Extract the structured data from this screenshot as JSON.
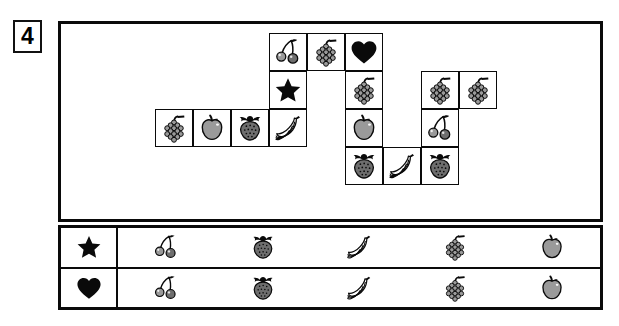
{
  "exercise": {
    "number": "4"
  },
  "puzzle": {
    "name": "fruit-crossword-grid",
    "cell_size": 38,
    "origin": {
      "x": 155,
      "y": 33
    },
    "cells": [
      {
        "col": 3,
        "row": 0,
        "icon": "cherries-icon"
      },
      {
        "col": 4,
        "row": 0,
        "icon": "grapes-icon"
      },
      {
        "col": 5,
        "row": 0,
        "icon": "heart-icon"
      },
      {
        "col": 3,
        "row": 1,
        "icon": "star-icon"
      },
      {
        "col": 5,
        "row": 1,
        "icon": "grapes-icon"
      },
      {
        "col": 7,
        "row": 1,
        "icon": "grapes-icon"
      },
      {
        "col": 8,
        "row": 1,
        "icon": "grapes-icon"
      },
      {
        "col": 0,
        "row": 2,
        "icon": "grapes-icon"
      },
      {
        "col": 1,
        "row": 2,
        "icon": "apple-icon"
      },
      {
        "col": 2,
        "row": 2,
        "icon": "strawberry-icon"
      },
      {
        "col": 3,
        "row": 2,
        "icon": "bananas-icon"
      },
      {
        "col": 5,
        "row": 2,
        "icon": "apple-icon"
      },
      {
        "col": 7,
        "row": 2,
        "icon": "cherries-icon"
      },
      {
        "col": 5,
        "row": 3,
        "icon": "strawberry-icon"
      },
      {
        "col": 6,
        "row": 3,
        "icon": "bananas-icon"
      },
      {
        "col": 7,
        "row": 3,
        "icon": "strawberry-icon"
      }
    ]
  },
  "legend": {
    "name": "answer-key-table",
    "rows": [
      {
        "symbol": "star-icon",
        "items": [
          "cherries-icon",
          "strawberry-icon",
          "bananas-icon",
          "grapes-icon",
          "apple-icon"
        ]
      },
      {
        "symbol": "heart-icon",
        "items": [
          "cherries-icon",
          "strawberry-icon",
          "bananas-icon",
          "grapes-icon",
          "apple-icon"
        ]
      }
    ]
  },
  "colors": {
    "ink": "#0a0a0a",
    "fruit_gray": "#9a9a9a",
    "fruit_gray_dark": "#6e6e6e",
    "paper": "#ffffff"
  }
}
